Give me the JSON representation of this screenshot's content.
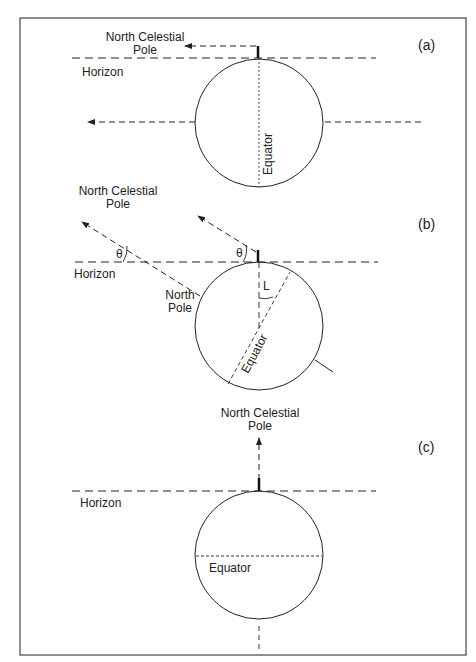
{
  "figure": {
    "panels": [
      {
        "id": "a",
        "panel_label": "(a)",
        "celestial_pole_label_line1": "North Celestial",
        "celestial_pole_label_line2": "Pole",
        "horizon_label": "Horizon",
        "equator_label": "Equator"
      },
      {
        "id": "b",
        "panel_label": "(b)",
        "celestial_pole_label_line1": "North Celestial",
        "celestial_pole_label_line2": "Pole",
        "horizon_label": "Horizon",
        "north_pole_label_line1": "North",
        "north_pole_label_line2": "Pole",
        "equator_label": "Equator",
        "angle_theta": "θ",
        "angle_latitude": "L"
      },
      {
        "id": "c",
        "panel_label": "(c)",
        "celestial_pole_label_line1": "North Celestial",
        "celestial_pole_label_line2": "Pole",
        "horizon_label": "Horizon",
        "equator_label": "Equator"
      }
    ],
    "colors": {
      "line": "#222222",
      "frame": "#444444",
      "background": "#ffffff"
    }
  }
}
